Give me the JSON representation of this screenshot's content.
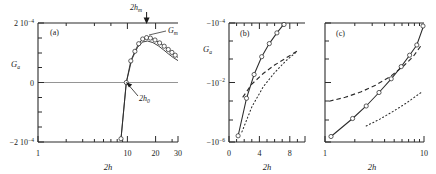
{
  "figure": {
    "caption_tags": [
      "(a)",
      "(b)",
      "(c)"
    ],
    "shared_xlabel": "2h",
    "shared_ylabel": "G",
    "ylabel_sub": "a"
  },
  "panel_a": {
    "tag": "(a)",
    "xlabel": "2h",
    "ylabel": "G",
    "ylabel_sub": "a",
    "xscale": "log",
    "yscale": "linear",
    "xlim": [
      1,
      30
    ],
    "ylim": [
      -0.0002,
      0.0002
    ],
    "xticks": [
      1,
      10,
      20,
      30
    ],
    "xtick_labels": [
      "1",
      "10",
      "20",
      "30"
    ],
    "yticks": [
      -0.0002,
      0,
      0.0002
    ],
    "ytick_labels": [
      "-2 10-4",
      "0",
      "2 10-4"
    ],
    "ytick_label_parts": [
      {
        "mantissa": "−2 10",
        "exp": "−4"
      },
      {
        "mantissa": "0",
        "exp": ""
      },
      {
        "mantissa": "2 10",
        "exp": "−4"
      }
    ],
    "annotations": [
      {
        "name": "2h-m",
        "text": "2h",
        "sub": "m",
        "marker": "down-arrow",
        "x": 14
      },
      {
        "name": "G-m",
        "text": "G",
        "sub": "m",
        "marker": "leader-line"
      },
      {
        "name": "2h-0",
        "text": "2h",
        "sub": "0",
        "marker": "arrow",
        "x": 9.8
      }
    ],
    "zero_line": true,
    "series": [
      {
        "name": "G_a curve",
        "style": "solid-with-circles",
        "points": [
          [
            8.6,
            -0.000162
          ],
          [
            9.8,
            0.0
          ],
          [
            10.6,
            3.8e-05
          ],
          [
            11.4,
            7.8e-05
          ],
          [
            12.2,
            0.00011
          ],
          [
            13.1,
            0.00013
          ],
          [
            14.0,
            0.000136
          ],
          [
            15.0,
            0.000134
          ],
          [
            16.2,
            0.000126
          ],
          [
            17.5,
            0.000114
          ],
          [
            19.0,
            0.0001
          ],
          [
            20.6,
            8.6e-05
          ],
          [
            22.3,
            7.4e-05
          ],
          [
            24.2,
            6.2e-05
          ],
          [
            26.2,
            5.2e-05
          ],
          [
            28.0,
            4.5e-05
          ],
          [
            30.0,
            4e-05
          ]
        ]
      },
      {
        "name": "G_a analytic",
        "style": "solid-thin",
        "points": [
          [
            8.6,
            -0.000162
          ],
          [
            9.8,
            0.0
          ],
          [
            11.0,
            6.2e-05
          ],
          [
            12.5,
            0.000116
          ],
          [
            14.0,
            0.000136
          ],
          [
            16.0,
            0.000128
          ],
          [
            18.5,
            0.000106
          ],
          [
            21.0,
            8.4e-05
          ],
          [
            24.0,
            6.4e-05
          ],
          [
            27.0,
            5e-05
          ],
          [
            30.0,
            4.1e-05
          ]
        ]
      }
    ]
  },
  "panel_b": {
    "tag": "(b)",
    "xlabel": "2h",
    "ylabel": "G",
    "ylabel_sub": "a",
    "xscale": "linear",
    "yscale": "neg-log",
    "xlim": [
      0,
      10
    ],
    "ylim_exp": [
      -4,
      -6
    ],
    "xticks": [
      0,
      4,
      8
    ],
    "xtick_labels": [
      "0",
      "4",
      "8"
    ],
    "ytick_labels": [
      "-10-4",
      "-10-2",
      "-10-6"
    ],
    "ytick_label_parts": [
      {
        "mantissa": "−10",
        "exp": "−4"
      },
      {
        "mantissa": "−10",
        "exp": "−2"
      },
      {
        "mantissa": "−10",
        "exp": "−6"
      }
    ],
    "series": [
      {
        "name": "numeric-with-circles",
        "style": "solid-with-circles",
        "points": [
          [
            1.2,
            -5.55
          ],
          [
            2.3,
            -4.92
          ],
          [
            3.3,
            -4.52
          ],
          [
            4.3,
            -4.22
          ],
          [
            5.3,
            -4.0
          ],
          [
            6.3,
            -3.82
          ],
          [
            7.3,
            -3.66
          ],
          [
            8.3,
            -3.52
          ],
          [
            9.0,
            -3.44
          ]
        ]
      },
      {
        "name": "dashed-asymptote",
        "style": "dashed",
        "points": [
          [
            1.8,
            -4.26
          ],
          [
            3.0,
            -4.04
          ],
          [
            4.5,
            -3.86
          ],
          [
            6.0,
            -3.72
          ],
          [
            7.5,
            -3.6
          ],
          [
            9.0,
            -3.48
          ]
        ]
      },
      {
        "name": "dotted-asymptote",
        "style": "dotted",
        "points": [
          [
            1.7,
            -5.42
          ],
          [
            3.0,
            -5.0
          ],
          [
            4.5,
            -4.66
          ],
          [
            6.0,
            -4.42
          ],
          [
            7.5,
            -4.22
          ],
          [
            9.0,
            -4.06
          ]
        ]
      }
    ]
  },
  "panel_c": {
    "tag": "(c)",
    "xlabel": "2h",
    "ylabel": "G",
    "ylabel_sub": "a",
    "xscale": "log",
    "yscale": "neg-log",
    "xlim": [
      1,
      10
    ],
    "ylim_exp": [
      -4,
      -6
    ],
    "xticks": [
      1,
      10
    ],
    "xtick_labels": [
      "1",
      "10"
    ],
    "series": [
      {
        "name": "numeric-with-circles",
        "style": "solid-with-circles",
        "points": [
          [
            1.15,
            -5.62
          ],
          [
            1.9,
            -5.28
          ],
          [
            2.6,
            -4.96
          ],
          [
            3.5,
            -4.62
          ],
          [
            4.6,
            -4.3
          ],
          [
            5.7,
            -4.02
          ],
          [
            6.9,
            -3.8
          ],
          [
            8.2,
            -3.6
          ],
          [
            9.6,
            -3.42
          ]
        ]
      },
      {
        "name": "dashed-asymptote",
        "style": "dashed",
        "points": [
          [
            1.1,
            -4.92
          ],
          [
            1.6,
            -4.8
          ],
          [
            2.3,
            -4.64
          ],
          [
            3.2,
            -4.44
          ],
          [
            4.4,
            -4.2
          ],
          [
            6.0,
            -3.94
          ],
          [
            7.6,
            -3.72
          ],
          [
            9.6,
            -3.44
          ]
        ]
      },
      {
        "name": "dotted-asymptote",
        "style": "dotted",
        "points": [
          [
            2.6,
            -5.34
          ],
          [
            3.6,
            -5.1
          ],
          [
            5.0,
            -4.84
          ],
          [
            6.6,
            -4.6
          ],
          [
            8.2,
            -4.42
          ],
          [
            9.8,
            -4.24
          ]
        ]
      }
    ]
  },
  "colors": {
    "axis": "#2b2b2b",
    "curve": "#2b2b2b",
    "marker_fill": "#ffffff",
    "background": "#ffffff"
  }
}
